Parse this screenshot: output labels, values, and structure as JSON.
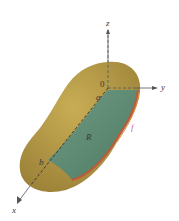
{
  "figure": {
    "labels": {
      "z_axis": "z",
      "y_axis": "y",
      "x_axis": "x",
      "origin": "0",
      "a": "a",
      "b": "b",
      "region": "R",
      "function": "f"
    },
    "colors": {
      "solid": "#b89a45",
      "solid_shadow": "#8f7a35",
      "region": "#5f8a70",
      "edge_red": "#c0583a",
      "edge_orange": "#d98b4a",
      "axis": "#555555",
      "f_label": "#c060b0"
    }
  }
}
